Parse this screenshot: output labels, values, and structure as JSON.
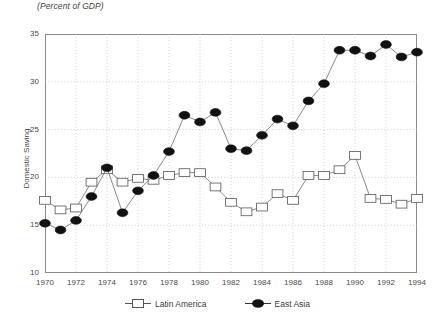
{
  "chart_data": {
    "type": "line",
    "title": "",
    "subtitle": "(Percent of GDP)",
    "xlabel": "",
    "ylabel": "Domestic Saving",
    "grid": true,
    "legend_position": "bottom",
    "xlim": [
      1970,
      1994
    ],
    "ylim": [
      10,
      35
    ],
    "yticks": [
      10,
      15,
      20,
      25,
      30,
      35
    ],
    "xticks": [
      1970,
      1972,
      1974,
      1976,
      1978,
      1980,
      1982,
      1984,
      1986,
      1988,
      1990,
      1992,
      1994
    ],
    "x": [
      1970,
      1971,
      1972,
      1973,
      1974,
      1975,
      1976,
      1977,
      1978,
      1979,
      1980,
      1981,
      1982,
      1983,
      1984,
      1985,
      1986,
      1987,
      1988,
      1989,
      1990,
      1991,
      1992,
      1993,
      1994
    ],
    "series": [
      {
        "name": "Latin America",
        "marker": "open-square",
        "color": "#ffffff",
        "edge_color": "#555555",
        "values": [
          17.6,
          16.6,
          16.8,
          19.5,
          20.8,
          19.5,
          19.9,
          19.7,
          20.2,
          20.5,
          20.5,
          19.0,
          17.4,
          16.4,
          16.9,
          18.3,
          17.6,
          20.2,
          20.2,
          20.8,
          22.3,
          17.8,
          17.7,
          17.2,
          17.8
        ]
      },
      {
        "name": "East Asia",
        "marker": "filled-circle",
        "color": "#111111",
        "edge_color": "#111111",
        "values": [
          15.2,
          14.5,
          15.5,
          18.0,
          21.0,
          16.3,
          18.6,
          20.2,
          22.7,
          26.5,
          25.8,
          26.8,
          23.0,
          22.8,
          24.4,
          26.1,
          25.4,
          28.0,
          29.8,
          33.3,
          33.3,
          32.7,
          33.9,
          32.6,
          33.1
        ]
      }
    ]
  },
  "legend": {
    "items": [
      {
        "label": "Latin America",
        "marker": "open-square"
      },
      {
        "label": "East Asia",
        "marker": "filled-circle"
      }
    ]
  }
}
